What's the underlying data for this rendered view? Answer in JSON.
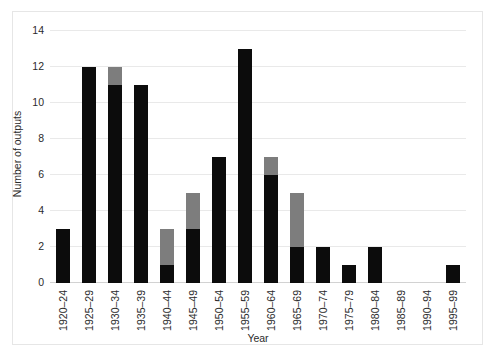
{
  "chart_data": {
    "type": "bar",
    "stacked": true,
    "title": "",
    "xlabel": "Year",
    "ylabel": "Number of outputs",
    "ylim": [
      0,
      14
    ],
    "yticks": [
      0,
      2,
      4,
      6,
      8,
      10,
      12,
      14
    ],
    "grid": true,
    "legend": "none",
    "categories": [
      "1920–24",
      "1925–29",
      "1930–34",
      "1935–39",
      "1940–44",
      "1945–49",
      "1950–54",
      "1955–59",
      "1960–64",
      "1965–69",
      "1970–74",
      "1975–79",
      "1980–84",
      "1985–89",
      "1990–94",
      "1995–99"
    ],
    "series": [
      {
        "name": "black",
        "color": "#0c0c0c",
        "values": [
          3,
          12,
          11,
          11,
          1,
          3,
          7,
          13,
          6,
          2,
          2,
          1,
          2,
          0,
          0,
          1
        ]
      },
      {
        "name": "gray",
        "color": "#7d7d7d",
        "values": [
          0,
          0,
          1,
          0,
          2,
          2,
          0,
          0,
          1,
          3,
          0,
          0,
          0,
          0,
          0,
          0
        ]
      }
    ],
    "totals": [
      3,
      12,
      12,
      11,
      3,
      5,
      7,
      13,
      7,
      5,
      2,
      1,
      2,
      0,
      0,
      1
    ]
  },
  "colors": {
    "black_series": "#0c0c0c",
    "gray_series": "#7d7d7d",
    "gridline": "#e9e9e9",
    "frame": "#e6e6e6",
    "background": "#ffffff",
    "text": "#2b2b2b"
  }
}
